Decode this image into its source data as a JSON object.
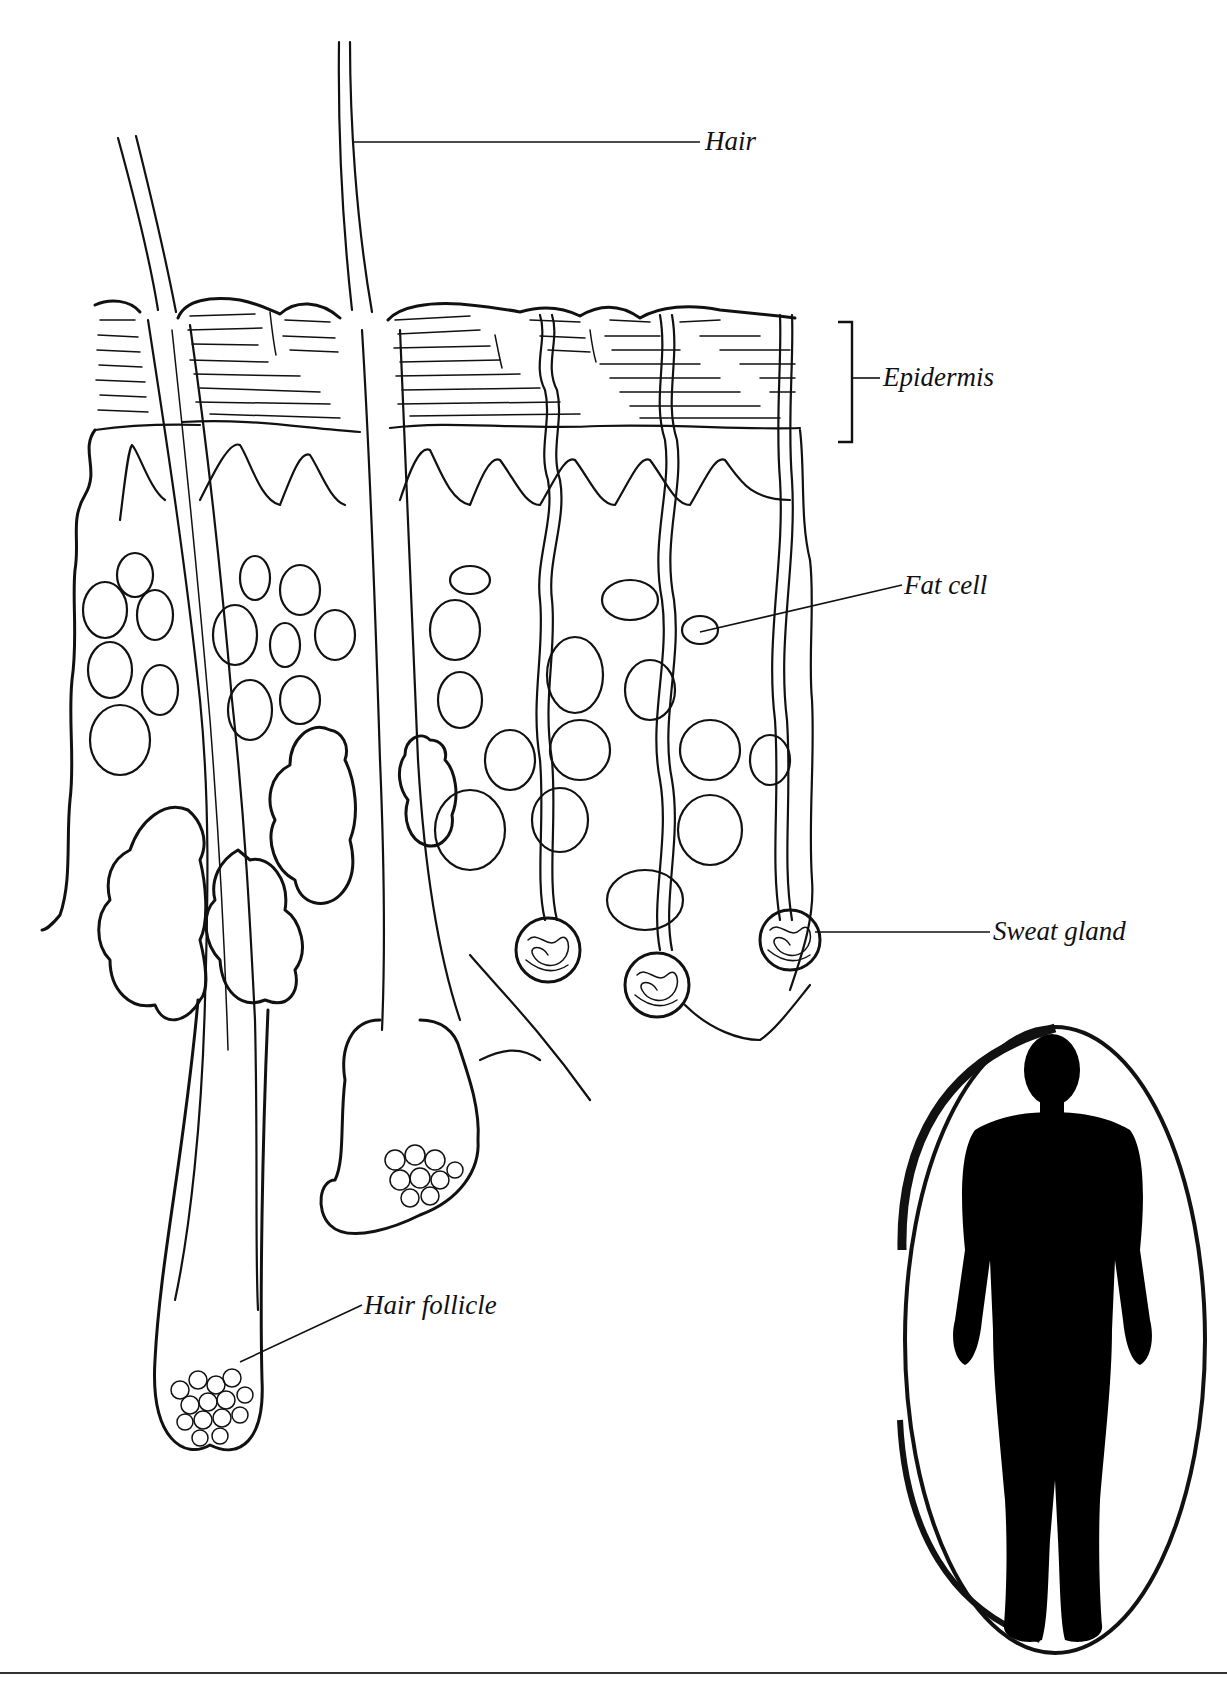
{
  "figure": {
    "colors": {
      "ink": "#111111",
      "background": "#ffffff"
    },
    "labels": [
      {
        "id": "hair",
        "text": "Hair"
      },
      {
        "id": "epidermis",
        "text": "Epidermis"
      },
      {
        "id": "fat-cell",
        "text": "Fat cell"
      },
      {
        "id": "sweat-gland",
        "text": "Sweat gland"
      },
      {
        "id": "hair-follicle",
        "text": "Hair follicle"
      }
    ],
    "inset": {
      "description": "human-body-silhouette-in-oval"
    }
  }
}
